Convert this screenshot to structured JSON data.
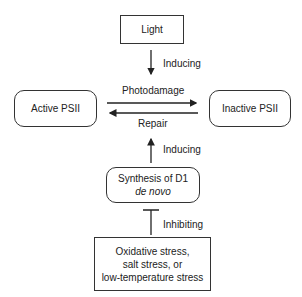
{
  "nodes": {
    "light": "Light",
    "active": "Active PSII",
    "inactive": "Inactive PSII",
    "synthesis_line1": "Synthesis of D1",
    "synthesis_line2": "de novo",
    "stress_line1": "Oxidative stress,",
    "stress_line2": "salt stress, or",
    "stress_line3": "low-temperature stress"
  },
  "edges": {
    "light_to_photodamage": "Inducing",
    "photodamage": "Photodamage",
    "repair": "Repair",
    "synthesis_to_repair": "Inducing",
    "stress_to_synthesis": "Inhibiting"
  }
}
